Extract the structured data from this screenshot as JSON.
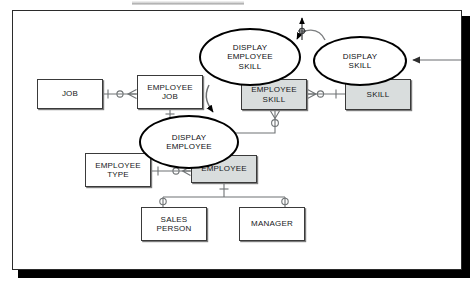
{
  "diagram": {
    "colors": {
      "shaded_entity_fill": "#d9dddd",
      "plain_entity_fill": "#ffffff",
      "line": "#6f7375",
      "stroke": "#3a3a3a",
      "process_stroke": "#000000",
      "frame_shadow": "#000000"
    },
    "entities": [
      {
        "id": "job",
        "label": "JOB",
        "shaded": false,
        "x": 24,
        "y": 68,
        "w": 66,
        "h": 30
      },
      {
        "id": "employee_job",
        "label": "EMPLOYEE\nJOB",
        "shaded": false,
        "x": 124,
        "y": 64,
        "w": 66,
        "h": 34
      },
      {
        "id": "employee_skill",
        "label": "EMPLOYEE\nSKILL",
        "shaded": true,
        "x": 228,
        "y": 68,
        "w": 66,
        "h": 31
      },
      {
        "id": "skill",
        "label": "SKILL",
        "shaded": true,
        "x": 332,
        "y": 68,
        "w": 66,
        "h": 31
      },
      {
        "id": "employee_type",
        "label": "EMPLOYEE\nTYPE",
        "shaded": false,
        "x": 72,
        "y": 142,
        "w": 66,
        "h": 34
      },
      {
        "id": "employee",
        "label": "EMPLOYEE",
        "shaded": true,
        "x": 178,
        "y": 144,
        "w": 66,
        "h": 28
      },
      {
        "id": "sales_person",
        "label": "SALES\nPERSON",
        "shaded": false,
        "x": 128,
        "y": 196,
        "w": 66,
        "h": 34
      },
      {
        "id": "manager",
        "label": "MANAGER",
        "shaded": false,
        "x": 226,
        "y": 196,
        "w": 66,
        "h": 34
      }
    ],
    "processes": [
      {
        "id": "display_employee_skill",
        "label": "DISPLAY\nEMPLOYEE\nSKILL",
        "x": 186,
        "y": 17,
        "w": 102,
        "h": 58
      },
      {
        "id": "display_skill",
        "label": "DISPLAY\nSKILL",
        "x": 300,
        "y": 25,
        "w": 94,
        "h": 50
      },
      {
        "id": "display_employee",
        "label": "DISPLAY\nEMPLOYEE",
        "x": 126,
        "y": 104,
        "w": 100,
        "h": 54
      }
    ],
    "relationships": [
      {
        "from": "job",
        "to": "employee_job",
        "from_marker": "one",
        "to_marker": "optional-many"
      },
      {
        "from": "employee_skill",
        "to": "skill",
        "from_marker": "many-optional",
        "to_marker": "one"
      },
      {
        "from": "employee_type",
        "to": "employee",
        "from_marker": "one",
        "to_marker": "optional-many"
      },
      {
        "from": "employee_job",
        "to": "employee",
        "from_marker": "one",
        "to_marker": "one"
      },
      {
        "from": "employee_skill",
        "to": "employee",
        "from_marker": "many-optional",
        "to_marker": "one"
      },
      {
        "from": "employee",
        "to": "sales_person",
        "from_marker": "one",
        "to_marker": "optional"
      },
      {
        "from": "employee",
        "to": "manager",
        "from_marker": "one",
        "to_marker": "optional"
      }
    ],
    "flows": [
      {
        "id": "flow-into-display-skill",
        "kind": "external-input-arrow",
        "note": "arrow from right frame edge into DISPLAY SKILL"
      },
      {
        "id": "flow-display-skill-to-employee-skill",
        "kind": "curved-arrow",
        "note": "curve from DISPLAY SKILL to DISPLAY EMPLOYEE SKILL"
      },
      {
        "id": "flow-up-output",
        "kind": "up-arrow",
        "note": "vertical output arrow above DISPLAY EMPLOYEE SKILL"
      },
      {
        "id": "flow-display-employee-skill-to-display-employee",
        "kind": "curved-arrow",
        "note": "curve down into DISPLAY EMPLOYEE"
      }
    ]
  }
}
